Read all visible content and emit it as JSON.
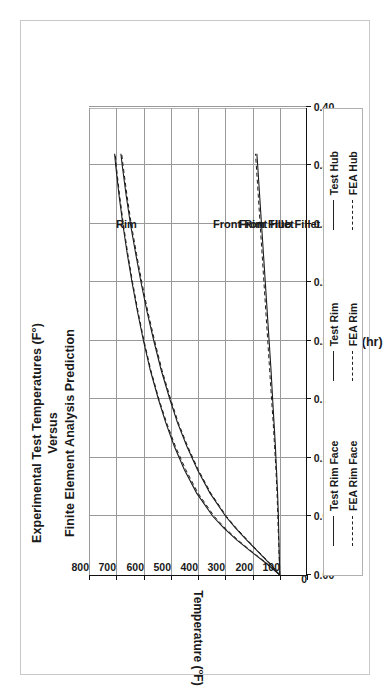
{
  "figure": {
    "title_lines": [
      "Experimental Test Temperatures (F°)",
      "Versus",
      "Finite Element Analysis Prediction"
    ],
    "xlabel": "Time (hr)",
    "ylabel_text": "Temperature (°F)",
    "ylabel_main": "Temperature (",
    "ylabel_sup": "o",
    "ylabel_tail": "F)"
  },
  "annotations": [
    {
      "name": "rim",
      "text": "Rim"
    },
    {
      "name": "front-rim-fillet",
      "text": "Front Rim Fillet"
    },
    {
      "name": "front-hub-fillet",
      "text": "Front Hub Fillet"
    }
  ],
  "legend": {
    "entries": [
      {
        "label": "Test Rim Face",
        "style": "solid"
      },
      {
        "label": "Test Rim",
        "style": "solid"
      },
      {
        "label": "Test Hub",
        "style": "solid"
      },
      {
        "label": "FEA Rim Face",
        "style": "dashed"
      },
      {
        "label": "FEA Rim",
        "style": "dashed"
      },
      {
        "label": "FEA Hub",
        "style": "dashed"
      }
    ]
  },
  "chart_data": {
    "type": "line",
    "title": "Experimental Test Temperatures (F°) Versus Finite Element Analysis Prediction",
    "xlabel": "Time (hr)",
    "ylabel": "Temperature (°F)",
    "xlim": [
      0.0,
      0.4
    ],
    "ylim": [
      0,
      800
    ],
    "xticks": [
      "0.00",
      "0.05",
      "0.10",
      "0.15",
      "0.20",
      "0.25",
      "0.30",
      "0.35",
      "0.40"
    ],
    "xtick_values": [
      0.0,
      0.05,
      0.1,
      0.15,
      0.2,
      0.25,
      0.3,
      0.35,
      0.4
    ],
    "yticks": [
      "0",
      "100",
      "200",
      "300",
      "400",
      "500",
      "600",
      "700",
      "800"
    ],
    "ytick_values": [
      0,
      100,
      200,
      300,
      400,
      500,
      600,
      700,
      800
    ],
    "grid": true,
    "legend_position": "below-plot",
    "series": [
      {
        "name": "Test Rim Face",
        "style": "solid",
        "x": [
          0.0,
          0.01,
          0.02,
          0.03,
          0.04,
          0.05,
          0.07,
          0.09,
          0.11,
          0.13,
          0.15,
          0.175,
          0.2,
          0.225,
          0.25,
          0.275,
          0.3,
          0.325,
          0.35,
          0.36
        ],
        "y": [
          100,
          150,
          205,
          258,
          305,
          345,
          405,
          450,
          487,
          518,
          545,
          575,
          600,
          622,
          642,
          660,
          676,
          690,
          702,
          706
        ]
      },
      {
        "name": "Test Rim",
        "style": "solid",
        "x": [
          0.0,
          0.01,
          0.02,
          0.03,
          0.04,
          0.05,
          0.07,
          0.09,
          0.11,
          0.13,
          0.15,
          0.175,
          0.2,
          0.225,
          0.25,
          0.275,
          0.3,
          0.325,
          0.35,
          0.36
        ],
        "y": [
          100,
          138,
          180,
          222,
          262,
          298,
          356,
          402,
          441,
          475,
          503,
          535,
          562,
          587,
          609,
          629,
          648,
          664,
          678,
          683
        ]
      },
      {
        "name": "Test Hub",
        "style": "solid",
        "x": [
          0.0,
          0.01,
          0.02,
          0.03,
          0.04,
          0.05,
          0.07,
          0.09,
          0.11,
          0.13,
          0.15,
          0.175,
          0.2,
          0.225,
          0.25,
          0.275,
          0.3,
          0.325,
          0.35,
          0.36
        ],
        "y": [
          100,
          101,
          102,
          103,
          104,
          105,
          108,
          112,
          116,
          121,
          126,
          132,
          139,
          146,
          153,
          160,
          167,
          174,
          181,
          184
        ]
      },
      {
        "name": "FEA Rim Face",
        "style": "dashed",
        "x": [
          0.0,
          0.01,
          0.02,
          0.03,
          0.04,
          0.05,
          0.07,
          0.09,
          0.11,
          0.13,
          0.15,
          0.175,
          0.2,
          0.225,
          0.25,
          0.275,
          0.3,
          0.325,
          0.35,
          0.36
        ],
        "y": [
          100,
          148,
          202,
          254,
          300,
          340,
          400,
          445,
          483,
          515,
          543,
          573,
          598,
          620,
          640,
          658,
          674,
          688,
          700,
          704
        ]
      },
      {
        "name": "FEA Rim",
        "style": "dashed",
        "x": [
          0.0,
          0.01,
          0.02,
          0.03,
          0.04,
          0.05,
          0.07,
          0.09,
          0.11,
          0.13,
          0.15,
          0.175,
          0.2,
          0.225,
          0.25,
          0.275,
          0.3,
          0.325,
          0.35,
          0.36
        ],
        "y": [
          100,
          136,
          178,
          219,
          259,
          295,
          353,
          399,
          438,
          472,
          500,
          532,
          559,
          584,
          606,
          626,
          645,
          661,
          675,
          680
        ]
      },
      {
        "name": "FEA Hub",
        "style": "dashed",
        "x": [
          0.0,
          0.01,
          0.02,
          0.03,
          0.04,
          0.05,
          0.07,
          0.09,
          0.11,
          0.13,
          0.15,
          0.175,
          0.2,
          0.225,
          0.25,
          0.275,
          0.3,
          0.325,
          0.35,
          0.36
        ],
        "y": [
          100,
          101,
          103,
          104,
          106,
          107,
          110,
          114,
          119,
          124,
          130,
          137,
          144,
          151,
          158,
          165,
          172,
          179,
          186,
          189
        ]
      }
    ],
    "annotations": [
      {
        "text": "Rim",
        "x": 0.305,
        "y": 700
      },
      {
        "text": "Front Rim Fillet",
        "x": 0.305,
        "y": 345
      },
      {
        "text": "Front Hub Fillet",
        "x": 0.305,
        "y": 250
      }
    ]
  }
}
